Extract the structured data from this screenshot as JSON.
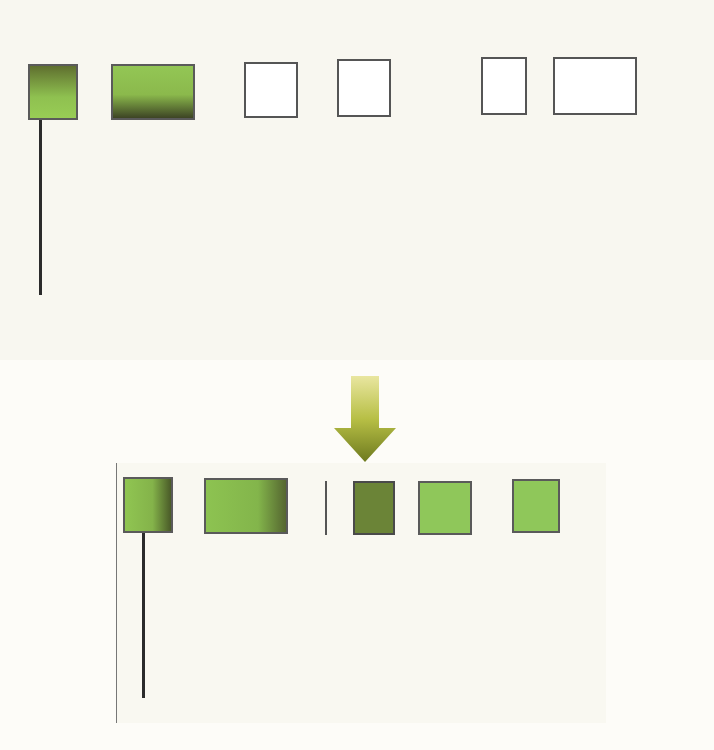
{
  "top_panel": {
    "words": [
      {
        "text": "你",
        "style": "g1"
      },
      {
        "text": "真的",
        "style": "g2"
      },
      {
        "text": "可",
        "style": "plain"
      },
      {
        "text": "爱",
        "style": "plain"
      },
      {
        "text": "得",
        "style": "plain"
      },
      {
        "text": "很哟",
        "style": "plain"
      }
    ]
  },
  "arrow": {
    "direction": "down",
    "color": "#9aa832"
  },
  "bottom_panel": {
    "words": [
      {
        "text": "你",
        "style": "g3"
      },
      {
        "text": "真的",
        "style": "g4"
      },
      {
        "text": "很",
        "style": "dark"
      },
      {
        "text": "可",
        "style": "flat"
      },
      {
        "text": "爱",
        "style": "flat"
      }
    ]
  },
  "colors": {
    "waveform": "#2b2b2b",
    "boundary": "#86c94f",
    "word_green": "#8fc75a",
    "word_dark_green": "#6b8437"
  }
}
